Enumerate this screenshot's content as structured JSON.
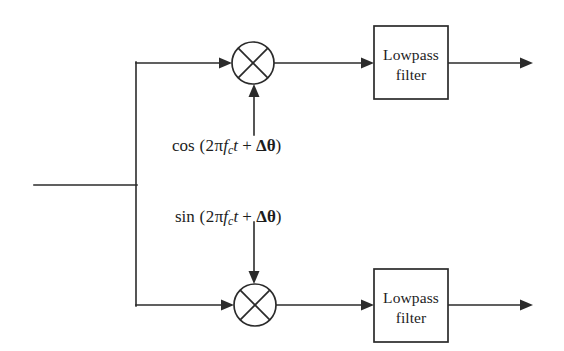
{
  "diagram": {
    "canvas": {
      "width": 564,
      "height": 351,
      "background": "#ffffff"
    },
    "line_color": "#2b2b2b",
    "blocks": [
      {
        "id": "lowpass-filter-top",
        "label_line1": "Lowpass",
        "label_line2": "filter",
        "x": 374,
        "y": 26,
        "w": 74,
        "h": 73
      },
      {
        "id": "lowpass-filter-bottom",
        "label_line1": "Lowpass",
        "label_line2": "filter",
        "x": 374,
        "y": 269,
        "w": 74,
        "h": 73
      }
    ],
    "mixers": [
      {
        "id": "mixer-top",
        "cx": 253,
        "cy": 63,
        "r": 21,
        "symbol": "multiplier-cross"
      },
      {
        "id": "mixer-bottom",
        "cx": 255,
        "cy": 305,
        "r": 21,
        "symbol": "multiplier-cross"
      }
    ],
    "carriers": [
      {
        "id": "carrier-cosine",
        "text": "cos (2πfᴄt + Δθ)",
        "function": "cos",
        "argument": "2πfᴄt + Δθ",
        "subscript": "c",
        "delta_symbol": "Δ",
        "theta_symbol": "θ",
        "pi_symbol": "π",
        "direction": "up",
        "x": 172,
        "y": 137
      },
      {
        "id": "carrier-sine",
        "text": "sin (2πfᴄt + Δθ)",
        "function": "sin",
        "argument": "2πfᴄt + Δθ",
        "subscript": "c",
        "delta_symbol": "Δ",
        "theta_symbol": "θ",
        "pi_symbol": "π",
        "direction": "down",
        "x": 175,
        "y": 208
      }
    ],
    "signal_paths": {
      "input_line_y": 185,
      "input_line_x_start": 34,
      "branch_x": 136,
      "top_branch_y": 63,
      "bottom_branch_y": 305,
      "output_arrow_x_end": 533
    }
  }
}
